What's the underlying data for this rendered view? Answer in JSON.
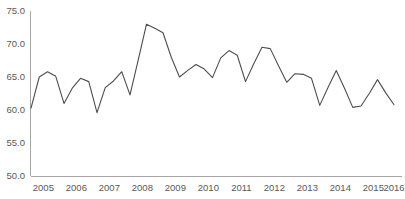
{
  "chart_data": {
    "type": "line",
    "title": "",
    "subtitle": "",
    "xlabel": "",
    "ylabel": "",
    "ylim": [
      50.0,
      75.0
    ],
    "yticks": [
      "50.0",
      "55.0",
      "60.0",
      "65.0",
      "70.0",
      "75.0"
    ],
    "ytick_values": [
      50.0,
      55.0,
      60.0,
      65.0,
      70.0,
      75.0
    ],
    "grid": false,
    "legend": null,
    "legend_position": "none",
    "xtick_labels": [
      "2005",
      "2006",
      "2007",
      "2008",
      "2009",
      "2010",
      "2011",
      "2012",
      "2013",
      "2014",
      "2015",
      "2016"
    ],
    "x_interval": "quarterly",
    "x": [
      "2005 Q1",
      "2005 Q2",
      "2005 Q3",
      "2005 Q4",
      "2006 Q1",
      "2006 Q2",
      "2006 Q3",
      "2006 Q4",
      "2007 Q1",
      "2007 Q2",
      "2007 Q3",
      "2007 Q4",
      "2008 Q1",
      "2008 Q2",
      "2008 Q3",
      "2008 Q4",
      "2009 Q1",
      "2009 Q2",
      "2009 Q3",
      "2009 Q4",
      "2010 Q1",
      "2010 Q2",
      "2010 Q3",
      "2010 Q4",
      "2011 Q1",
      "2011 Q2",
      "2011 Q3",
      "2011 Q4",
      "2012 Q1",
      "2012 Q2",
      "2012 Q3",
      "2012 Q4",
      "2013 Q1",
      "2013 Q2",
      "2013 Q3",
      "2013 Q4",
      "2014 Q1",
      "2014 Q2",
      "2014 Q3",
      "2014 Q4",
      "2015 Q1",
      "2015 Q2",
      "2015 Q3",
      "2015 Q4",
      "2016 Q1"
    ],
    "values": [
      60.3,
      65.0,
      65.8,
      65.1,
      61.0,
      63.3,
      64.8,
      64.3,
      59.6,
      63.4,
      64.4,
      65.8,
      62.3,
      67.6,
      73.0,
      72.4,
      71.7,
      68.0,
      65.0,
      66.0,
      66.9,
      66.2,
      64.9,
      67.9,
      69.0,
      68.3,
      64.3,
      67.0,
      69.5,
      69.3,
      66.7,
      64.2,
      65.5,
      65.4,
      64.8,
      60.7,
      63.4,
      66.0,
      63.3,
      60.4,
      60.6,
      62.5,
      64.6,
      62.6,
      60.8
    ],
    "series": [
      {
        "name": "series-1",
        "color": "#4d4d4d",
        "values": [
          60.3,
          65.0,
          65.8,
          65.1,
          61.0,
          63.3,
          64.8,
          64.3,
          59.6,
          63.4,
          64.4,
          65.8,
          62.3,
          67.6,
          73.0,
          72.4,
          71.7,
          68.0,
          65.0,
          66.0,
          66.9,
          66.2,
          64.9,
          67.9,
          69.0,
          68.3,
          64.3,
          67.0,
          69.5,
          69.3,
          66.7,
          64.2,
          65.5,
          65.4,
          64.8,
          60.7,
          63.4,
          66.0,
          63.3,
          60.4,
          60.6,
          62.5,
          64.6,
          62.6,
          60.8
        ]
      }
    ]
  },
  "colors": {
    "line": "#4d4d4d",
    "axis": "#a6a6a6",
    "tick_text": "#595959",
    "background": "#ffffff"
  },
  "watermark": {
    "text": ""
  }
}
